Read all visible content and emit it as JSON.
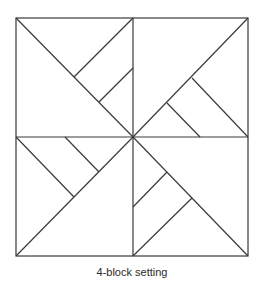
{
  "caption": "4-block setting",
  "diagram": {
    "stroke_color": "#3a3a3a",
    "background": "#ffffff",
    "outer_square": {
      "x1": 16,
      "y1": 18,
      "x2": 248,
      "y2": 256
    },
    "center": {
      "x": 133,
      "y": 137
    },
    "blocks": [
      {
        "name": "top-left",
        "lines": [
          [
            16,
            18,
            133,
            137
          ],
          [
            133,
            18,
            74,
            77
          ],
          [
            133,
            68,
            99,
            102
          ]
        ]
      },
      {
        "name": "top-right",
        "lines": [
          [
            133,
            137,
            248,
            18
          ],
          [
            192,
            78,
            248,
            137
          ],
          [
            167,
            103,
            200,
            137
          ]
        ]
      },
      {
        "name": "bottom-left",
        "lines": [
          [
            16,
            256,
            133,
            137
          ],
          [
            16,
            137,
            74,
            197
          ],
          [
            65,
            137,
            99,
            172
          ]
        ]
      },
      {
        "name": "bottom-right",
        "lines": [
          [
            133,
            137,
            248,
            256
          ],
          [
            192,
            198,
            133,
            256
          ],
          [
            167,
            172,
            133,
            207
          ]
        ]
      }
    ]
  }
}
